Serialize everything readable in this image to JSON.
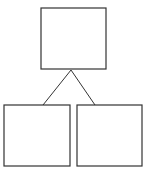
{
  "diagram": {
    "type": "tree",
    "stroke_color": "#333333",
    "background": "#ffffff",
    "nodes": [
      {
        "id": "root",
        "label": "",
        "x": 41,
        "y": 8,
        "w": 65,
        "h": 61
      },
      {
        "id": "left-child",
        "label": "",
        "x": 4,
        "y": 105,
        "w": 66,
        "h": 61
      },
      {
        "id": "right-child",
        "label": "",
        "x": 77,
        "y": 105,
        "w": 65,
        "h": 61
      }
    ],
    "edges": [
      {
        "from": "root",
        "to": "left-child"
      },
      {
        "from": "root",
        "to": "right-child"
      }
    ]
  }
}
